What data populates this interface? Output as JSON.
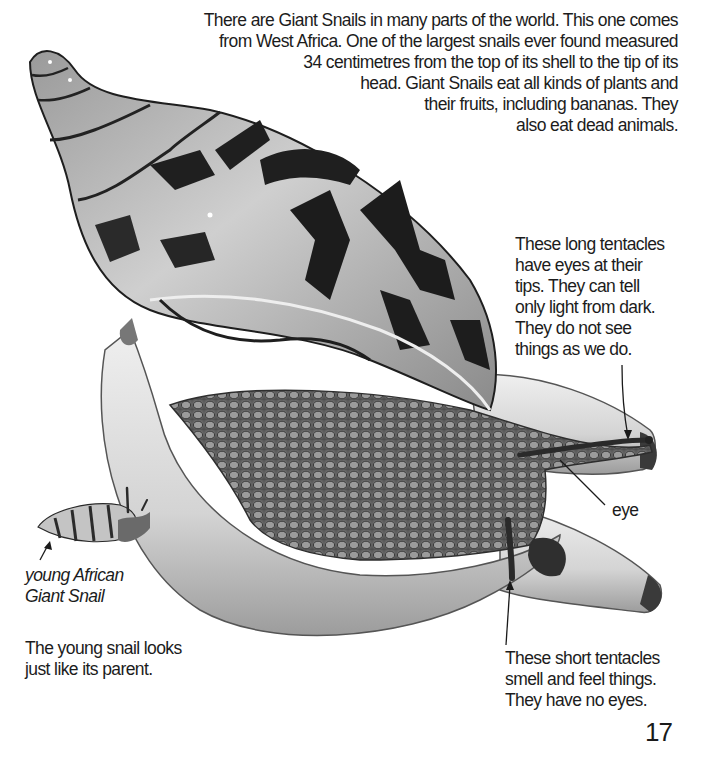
{
  "page": {
    "number": "17",
    "background": "#ffffff",
    "ink_color": "#1c1c1c"
  },
  "intro_paragraph": {
    "lines": [
      "There are Giant Snails in many parts of the world. This one comes",
      "from West Africa. One of the largest snails ever found measured",
      "34 centimetres from the top of its shell to the tip of its",
      "head. Giant Snails eat all kinds of plants and",
      "their fruits, including bananas. They",
      "also eat dead animals."
    ]
  },
  "captions": {
    "long_tentacles": {
      "lines": [
        "These long tentacles",
        "have eyes at their",
        "tips. They can tell",
        "only light from dark.",
        "They do not see",
        "things as we do."
      ]
    },
    "eye": {
      "label": "eye"
    },
    "young_snail": {
      "lines": [
        "young African",
        "Giant Snail"
      ]
    },
    "parent_note": {
      "lines": [
        "The young snail looks",
        "just like its parent."
      ]
    },
    "short_tentacles": {
      "lines": [
        "These short tentacles",
        "smell and feel things.",
        "They have no eyes."
      ]
    }
  },
  "illustration": {
    "subjects": [
      "giant-african-snail",
      "young-african-giant-snail",
      "bananas"
    ],
    "palette": {
      "shell_light": "#bdbdbd",
      "shell_dark": "#1e1e1e",
      "body_skin": "#6e6e6e",
      "banana": "#d9d9d9",
      "banana_shadow": "#a8a8a8"
    }
  }
}
